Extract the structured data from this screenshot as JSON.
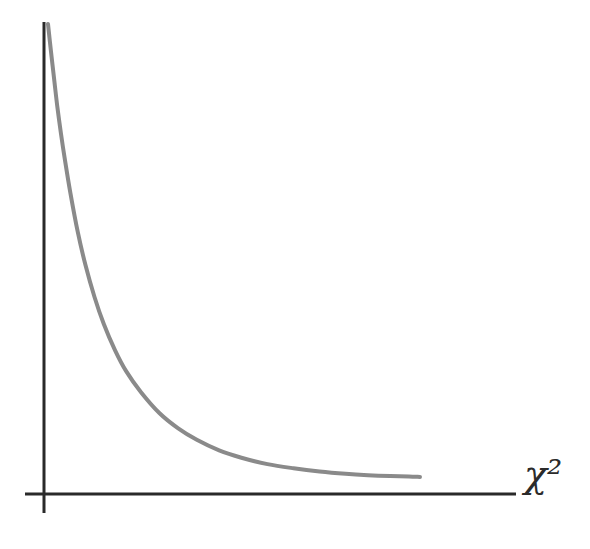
{
  "figure": {
    "title": "",
    "background_color": "#ffffff",
    "width": 590,
    "height": 549,
    "media": "scanned-illustration"
  },
  "axes": {
    "x_axis": {
      "name": "horizontal-axis",
      "label": "χ²",
      "label_plain": "chi-squared",
      "color": "#2a2a2a",
      "stroke_width": 3,
      "x_start": 25,
      "x_end": 516,
      "y": 494,
      "tick_labels": [],
      "gridlines": false
    },
    "y_axis": {
      "name": "vertical-axis",
      "label": "",
      "color": "#2a2a2a",
      "stroke_width": 3,
      "x": 44,
      "y_start": 22,
      "y_end": 513,
      "tick_labels": [],
      "gridlines": false
    }
  },
  "chart_data": {
    "type": "line",
    "title": "",
    "subtitle": "",
    "xlabel": "χ²",
    "ylabel": "",
    "grid": false,
    "legend": null,
    "legend_position": "none",
    "axis_ticks_shown": false,
    "xlim": [
      0,
      10
    ],
    "ylim": [
      0,
      1
    ],
    "series": [
      {
        "name": "chi-squared probability density",
        "color": "#8a8a8a",
        "line_width": 4,
        "style": "solid",
        "description": "monotonically decreasing convex curve approaching the horizontal axis asymptotically",
        "x": [
          0.0,
          0.08,
          0.17,
          0.25,
          0.35,
          0.45,
          0.6,
          0.8,
          1.0,
          1.25,
          1.5,
          1.8,
          2.1,
          2.5,
          3.0,
          3.5,
          4.0,
          4.6,
          5.2,
          5.9,
          6.6,
          7.3,
          8.0,
          8.6,
          9.2,
          9.7,
          10.0
        ],
        "y": [
          1.0,
          0.94,
          0.876,
          0.82,
          0.76,
          0.706,
          0.632,
          0.546,
          0.476,
          0.404,
          0.345,
          0.288,
          0.242,
          0.196,
          0.15,
          0.117,
          0.092,
          0.069,
          0.053,
          0.039,
          0.03,
          0.023,
          0.018,
          0.015,
          0.013,
          0.012,
          0.011
        ]
      }
    ],
    "curve_pixel_path": {
      "start": [
        48,
        24
      ],
      "end": [
        420,
        482
      ],
      "asymptote_y": 494
    }
  },
  "annotations": []
}
